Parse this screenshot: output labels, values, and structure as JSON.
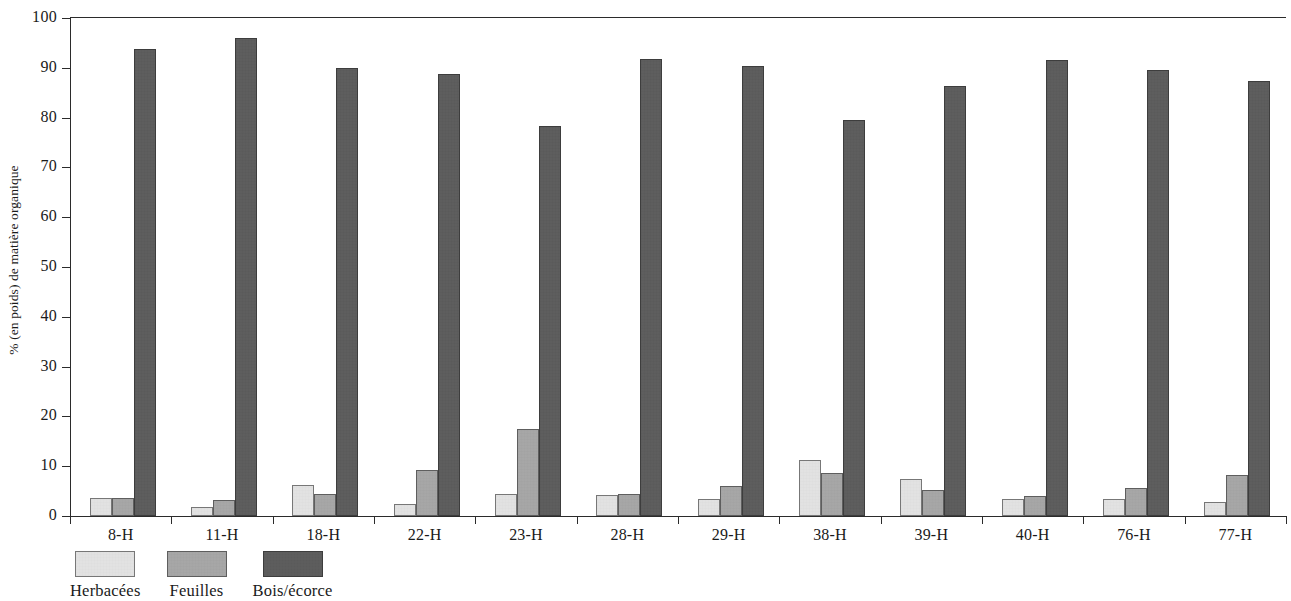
{
  "chart_data": {
    "type": "bar",
    "title": "",
    "xlabel": "",
    "ylabel": "% (en poids) de matière organique",
    "ylim": [
      0,
      100
    ],
    "ytick_step": 10,
    "yticks": [
      0,
      10,
      20,
      30,
      40,
      50,
      60,
      70,
      80,
      90,
      100
    ],
    "grid": false,
    "legend_position": "bottom-left",
    "categories": [
      "8-H",
      "11-H",
      "18-H",
      "22-H",
      "23-H",
      "28-H",
      "29-H",
      "38-H",
      "39-H",
      "40-H",
      "76-H",
      "77-H"
    ],
    "series": [
      {
        "name": "Herbacées",
        "color": "#e2e2e2",
        "values": [
          3.6,
          1.9,
          6.2,
          2.5,
          4.4,
          4.2,
          3.4,
          11.2,
          7.5,
          3.5,
          3.5,
          2.8
        ]
      },
      {
        "name": "Feuilles",
        "color": "#a6a6a6",
        "values": [
          3.6,
          3.2,
          4.4,
          9.3,
          17.5,
          4.4,
          6.1,
          8.6,
          5.3,
          4.1,
          5.6,
          8.2
        ]
      },
      {
        "name": "Bois/écorce",
        "color": "#5c5c5c",
        "values": [
          93.7,
          96.0,
          89.9,
          88.7,
          78.3,
          91.8,
          90.4,
          79.6,
          86.3,
          91.6,
          89.5,
          87.3
        ]
      }
    ]
  },
  "axis": {
    "y_title": "% (en poids) de matière organique",
    "y_tick_labels": [
      "100",
      "90",
      "80",
      "70",
      "60",
      "50",
      "40",
      "30",
      "20",
      "10",
      "0"
    ],
    "x_tick_labels": [
      "8-H",
      "11-H",
      "18-H",
      "22-H",
      "23-H",
      "28-H",
      "29-H",
      "38-H",
      "39-H",
      "40-H",
      "76-H",
      "77-H"
    ]
  },
  "legend": {
    "items": [
      {
        "label": "Herbacées",
        "color": "#e2e2e2"
      },
      {
        "label": "Feuilles",
        "color": "#a6a6a6"
      },
      {
        "label": "Bois/écorce",
        "color": "#5c5c5c"
      }
    ]
  }
}
